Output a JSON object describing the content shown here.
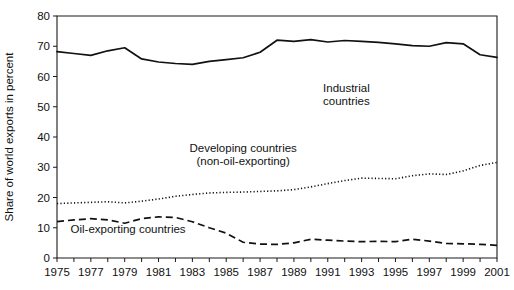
{
  "chart_data": {
    "type": "line",
    "title": "",
    "subtitle": "",
    "xlabel": "",
    "ylabel": "Share of world exports in percent",
    "xlim": [
      1975,
      2001
    ],
    "ylim": [
      0,
      80
    ],
    "grid": false,
    "legend_position": "inline-annotations",
    "x": [
      1975,
      1976,
      1977,
      1978,
      1979,
      1980,
      1981,
      1982,
      1983,
      1984,
      1985,
      1986,
      1987,
      1988,
      1989,
      1990,
      1991,
      1992,
      1993,
      1994,
      1995,
      1996,
      1997,
      1998,
      1999,
      2000,
      2001
    ],
    "xtick_labels": [
      "1975",
      "1977",
      "1979",
      "1981",
      "1983",
      "1985",
      "1987",
      "1989",
      "1991",
      "1993",
      "1995",
      "1997",
      "1999",
      "2001"
    ],
    "xtick_values": [
      1975,
      1977,
      1979,
      1981,
      1983,
      1985,
      1987,
      1989,
      1991,
      1993,
      1995,
      1997,
      1999,
      2001
    ],
    "ytick_labels": [
      "0",
      "10",
      "20",
      "30",
      "40",
      "50",
      "60",
      "70",
      "80"
    ],
    "ytick_values": [
      0,
      10,
      20,
      30,
      40,
      50,
      60,
      70,
      80
    ],
    "series": [
      {
        "name": "Industrial countries",
        "style": "solid",
        "label_lines": [
          "Industrial",
          "countries"
        ],
        "label_x": 1992.1,
        "label_y": 55.0,
        "values": [
          68.2,
          67.6,
          67.0,
          68.5,
          69.5,
          65.8,
          64.8,
          64.3,
          64.0,
          65.0,
          65.6,
          66.2,
          68.0,
          72.0,
          71.6,
          72.2,
          71.4,
          71.9,
          71.6,
          71.3,
          70.8,
          70.2,
          70.0,
          71.2,
          70.8,
          67.2,
          66.3
        ]
      },
      {
        "name": "Developing countries (non-oil-exporting)",
        "style": "dotted",
        "label_lines": [
          "Developing countries",
          "(non-oil-exporting)"
        ],
        "label_x": 1986.0,
        "label_y": 35.2,
        "values": [
          18.0,
          18.2,
          18.4,
          18.6,
          18.2,
          18.8,
          19.5,
          20.4,
          21.0,
          21.5,
          21.7,
          21.8,
          22.0,
          22.2,
          22.6,
          23.5,
          24.6,
          25.6,
          26.4,
          26.3,
          26.2,
          27.2,
          27.8,
          27.6,
          28.8,
          30.6,
          31.6
        ]
      },
      {
        "name": "Oil-exporting countries",
        "style": "dashed",
        "label_lines": [
          "Oil-exporting countries"
        ],
        "label_x": 1979.2,
        "label_y": 8.2,
        "values": [
          12.0,
          12.6,
          13.0,
          12.6,
          11.5,
          13.0,
          13.6,
          13.4,
          12.0,
          10.0,
          8.2,
          5.2,
          4.6,
          4.5,
          5.0,
          6.2,
          5.9,
          5.6,
          5.4,
          5.5,
          5.4,
          6.2,
          5.6,
          4.8,
          4.7,
          4.5,
          4.2
        ]
      }
    ]
  }
}
